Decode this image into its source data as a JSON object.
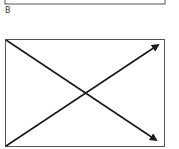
{
  "panel_label": "B",
  "colors": {
    "stroke": "#1a1a1a",
    "box": "#555555",
    "background": "#ffffff"
  },
  "top_box": {
    "x": 5,
    "y": -20,
    "width": 160,
    "height": 24
  },
  "main_box": {
    "x": 5,
    "y": 39,
    "width": 160,
    "height": 108
  },
  "arrows": [
    {
      "name": "diagonal-down-arrow",
      "from": [
        5,
        39
      ],
      "to": [
        158,
        141
      ]
    },
    {
      "name": "diagonal-up-arrow",
      "from": [
        5,
        147
      ],
      "to": [
        160,
        44
      ]
    }
  ]
}
